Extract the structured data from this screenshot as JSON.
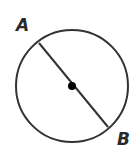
{
  "diagram": {
    "type": "circle-diameter",
    "colors": {
      "stroke": "#333333",
      "center": "#000000",
      "label": "#2a2a2a"
    },
    "circle": {
      "cx": 72,
      "cy": 86,
      "r": 56
    },
    "center_point": {
      "x": 72,
      "y": 86,
      "r": 4
    },
    "diameter": {
      "x1": 39,
      "y1": 43,
      "x2": 108,
      "y2": 127
    },
    "labels": [
      {
        "text": "A",
        "x": 16,
        "y": 31
      },
      {
        "text": "B",
        "x": 117,
        "y": 145
      }
    ]
  }
}
